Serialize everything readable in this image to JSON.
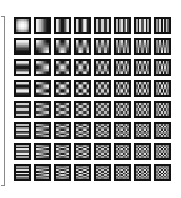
{
  "figure": {
    "rows": 8,
    "cols": 8,
    "cell_pitch_x": 20,
    "cell_pitch_y": 21,
    "cell_size": 17,
    "samples_per_cell": 8,
    "frame_color": "#111111",
    "bracket_color": "#8a8a8a"
  }
}
